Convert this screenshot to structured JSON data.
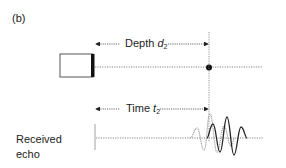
{
  "figure": {
    "panel_label": "(b)",
    "depth": {
      "text": "Depth ",
      "var": "d",
      "sub": "2"
    },
    "time": {
      "text": "Time ",
      "var": "t",
      "sub": "2"
    },
    "echo_label_line1": "Received",
    "echo_label_line2": "echo",
    "colors": {
      "line": "#444444",
      "transducer_face": "#111111",
      "transmitted_wave": "#9a9a9a",
      "received_wave": "#222222"
    }
  }
}
